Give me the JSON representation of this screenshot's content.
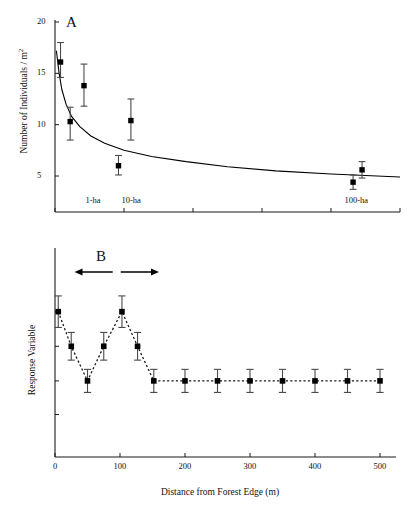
{
  "figure": {
    "panels": [
      {
        "letter": "A",
        "ylabel": "Number of Individuals / m",
        "ylabel_sup": "2",
        "ytick_labels": [
          "20",
          "15",
          "10",
          "5"
        ],
        "ytick_values": [
          20,
          15,
          10,
          5
        ],
        "annotations": [
          "1-ha",
          "10-ha",
          "100-ha"
        ]
      },
      {
        "letter": "B",
        "ylabel": "Response Variable",
        "xlabel": "Distance from Forest Edge (m)",
        "xtick_labels": [
          "0",
          "100",
          "200",
          "300",
          "400",
          "500"
        ],
        "xtick_values": [
          0,
          100,
          200,
          300,
          400,
          500
        ]
      }
    ],
    "colors": {
      "axis": "#1a1a1a",
      "marker": "#000000",
      "errorbar": "#4a4a4a",
      "curve": "#000000",
      "dotted": "#1a1a1a"
    }
  },
  "chart_data": [
    {
      "type": "scatter",
      "panel": "A",
      "title": "",
      "xlabel": "",
      "ylabel": "Number of Individuals / m2",
      "ylim": [
        0,
        20
      ],
      "xlim": [
        0,
        500
      ],
      "grid": false,
      "legend": "none",
      "ytick_labels": [
        "20",
        "15",
        "10",
        "5"
      ],
      "annotations": [
        {
          "text": "1-ha",
          "x": 55,
          "y": 2.5
        },
        {
          "text": "10-ha",
          "x": 110,
          "y": 2.5
        },
        {
          "text": "100-ha",
          "x": 437,
          "y": 2.5
        }
      ],
      "points": [
        {
          "x": 8,
          "y": 16.1,
          "yerr_low": 1.5,
          "yerr_high": 1.9
        },
        {
          "x": 22,
          "y": 10.3,
          "yerr_low": 1.8,
          "yerr_high": 1.4
        },
        {
          "x": 42,
          "y": 13.8,
          "yerr_low": 2.0,
          "yerr_high": 2.1
        },
        {
          "x": 92,
          "y": 6.0,
          "yerr_low": 0.9,
          "yerr_high": 1.0
        },
        {
          "x": 110,
          "y": 10.4,
          "yerr_low": 1.9,
          "yerr_high": 2.1
        },
        {
          "x": 432,
          "y": 4.4,
          "yerr_low": 0.7,
          "yerr_high": 0.7
        },
        {
          "x": 445,
          "y": 5.6,
          "yerr_low": 0.8,
          "yerr_high": 0.8
        }
      ],
      "fitted_curve": {
        "description": "decreasing power/exponential decay fit",
        "x": [
          2,
          6,
          10,
          16,
          24,
          36,
          52,
          72,
          100,
          140,
          190,
          250,
          320,
          400,
          500
        ],
        "y": [
          17.2,
          15.0,
          13.4,
          12.0,
          10.8,
          9.8,
          8.9,
          8.2,
          7.5,
          6.9,
          6.4,
          5.9,
          5.5,
          5.2,
          4.9
        ]
      }
    },
    {
      "type": "line",
      "panel": "B",
      "title": "",
      "xlabel": "Distance from Forest Edge (m)",
      "ylabel": "Response Variable",
      "xlim": [
        0,
        510
      ],
      "ylim": [
        0,
        1
      ],
      "grid": false,
      "legend": "none",
      "linestyle": "dotted",
      "xtick_labels": [
        "0",
        "100",
        "200",
        "300",
        "400",
        "500"
      ],
      "annotation_arrow": {
        "label": "edge effect extent",
        "x_start": 30,
        "x_end": 160,
        "y": 0.93
      },
      "points": [
        {
          "x": 5,
          "y": 0.735,
          "yerr_low": 0.082,
          "yerr_high": 0.082
        },
        {
          "x": 25,
          "y": 0.555,
          "yerr_low": 0.072,
          "yerr_high": 0.072
        },
        {
          "x": 50,
          "y": 0.375,
          "yerr_low": 0.06,
          "yerr_high": 0.06
        },
        {
          "x": 75,
          "y": 0.555,
          "yerr_low": 0.072,
          "yerr_high": 0.072
        },
        {
          "x": 103,
          "y": 0.735,
          "yerr_low": 0.082,
          "yerr_high": 0.082
        },
        {
          "x": 127,
          "y": 0.555,
          "yerr_low": 0.072,
          "yerr_high": 0.072
        },
        {
          "x": 152,
          "y": 0.375,
          "yerr_low": 0.06,
          "yerr_high": 0.06
        },
        {
          "x": 200,
          "y": 0.375,
          "yerr_low": 0.06,
          "yerr_high": 0.06
        },
        {
          "x": 250,
          "y": 0.375,
          "yerr_low": 0.06,
          "yerr_high": 0.06
        },
        {
          "x": 300,
          "y": 0.375,
          "yerr_low": 0.06,
          "yerr_high": 0.06
        },
        {
          "x": 350,
          "y": 0.375,
          "yerr_low": 0.06,
          "yerr_high": 0.06
        },
        {
          "x": 400,
          "y": 0.375,
          "yerr_low": 0.06,
          "yerr_high": 0.06
        },
        {
          "x": 450,
          "y": 0.375,
          "yerr_low": 0.06,
          "yerr_high": 0.06
        },
        {
          "x": 500,
          "y": 0.375,
          "yerr_low": 0.06,
          "yerr_high": 0.06
        }
      ]
    }
  ]
}
